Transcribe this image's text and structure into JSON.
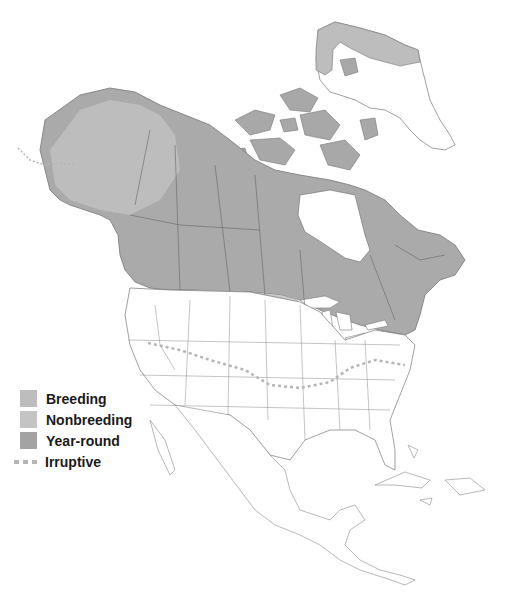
{
  "map": {
    "region": "North America",
    "colors": {
      "breeding": "#bdbdbd",
      "nonbreeding": "#c4c4c4",
      "year_round": "#a3a3a3",
      "irruptive": "#b5b5b5",
      "land": "#ffffff",
      "border": "#6a6a6a"
    }
  },
  "legend": {
    "items": [
      {
        "label": "Breeding",
        "type": "swatch",
        "color": "#bdbdbd"
      },
      {
        "label": "Nonbreeding",
        "type": "swatch",
        "color": "#c4c4c4"
      },
      {
        "label": "Year-round",
        "type": "swatch",
        "color": "#a3a3a3"
      },
      {
        "label": "Irruptive",
        "type": "dashed-line",
        "color": "#b5b5b5"
      }
    ]
  }
}
